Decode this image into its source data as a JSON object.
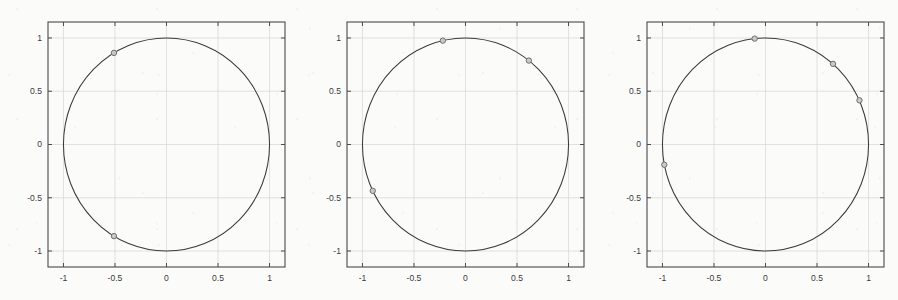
{
  "figure": {
    "background_color": "#fbfbfa",
    "axis_color": "#4a4a4a",
    "grid_color": "#d6d6d6",
    "curve_color": "#3b3b3b",
    "marker_edge_color": "#6f6f6f",
    "marker_face_color": "#c9c9c9",
    "panel_count": 3
  },
  "chart_data": [
    {
      "type": "scatter",
      "title": "",
      "xlabel": "",
      "ylabel": "",
      "xlim": [
        -1.15,
        1.15
      ],
      "ylim": [
        -1.15,
        1.15
      ],
      "xticks": [
        -1,
        -0.5,
        0,
        0.5,
        1
      ],
      "yticks": [
        -1,
        -0.5,
        0,
        0.5,
        1
      ],
      "xticklabels": [
        "-1",
        "-0.5",
        "0",
        "0.5",
        "1"
      ],
      "yticklabels": [
        "-1",
        "-0.5",
        "0",
        "0.5",
        "1"
      ],
      "grid": true,
      "legend": "none",
      "series": [
        {
          "name": "unit circle",
          "style": "line",
          "x": [],
          "y": []
        },
        {
          "name": "markers",
          "style": "open-circle",
          "points": [
            {
              "x": -0.51,
              "y": 0.86
            },
            {
              "x": -0.51,
              "y": -0.86
            }
          ]
        }
      ]
    },
    {
      "type": "scatter",
      "title": "",
      "xlabel": "",
      "ylabel": "",
      "xlim": [
        -1.15,
        1.15
      ],
      "ylim": [
        -1.15,
        1.15
      ],
      "xticks": [
        -1,
        -0.5,
        0,
        0.5,
        1
      ],
      "yticks": [
        -1,
        -0.5,
        0,
        0.5,
        1
      ],
      "xticklabels": [
        "-1",
        "-0.5",
        "0",
        "0.5",
        "1"
      ],
      "yticklabels": [
        "-1",
        "-0.5",
        "0",
        "0.5",
        "1"
      ],
      "grid": true,
      "legend": "none",
      "series": [
        {
          "name": "unit circle",
          "style": "line",
          "x": [],
          "y": []
        },
        {
          "name": "markers",
          "style": "open-circle",
          "points": [
            {
              "x": -0.22,
              "y": 0.975
            },
            {
              "x": 0.615,
              "y": 0.788
            },
            {
              "x": -0.9,
              "y": -0.435
            }
          ]
        }
      ]
    },
    {
      "type": "scatter",
      "title": "",
      "xlabel": "",
      "ylabel": "",
      "xlim": [
        -1.15,
        1.15
      ],
      "ylim": [
        -1.15,
        1.15
      ],
      "xticks": [
        -1,
        -0.5,
        0,
        0.5,
        1
      ],
      "yticks": [
        -1,
        -0.5,
        0,
        0.5,
        1
      ],
      "xticklabels": [
        "-1",
        "-0.5",
        "0",
        "0.5",
        "1"
      ],
      "yticklabels": [
        "-1",
        "-0.5",
        "0",
        "0.5",
        "1"
      ],
      "grid": true,
      "legend": "none",
      "series": [
        {
          "name": "unit circle",
          "style": "line",
          "x": [],
          "y": []
        },
        {
          "name": "markers",
          "style": "open-circle",
          "points": [
            {
              "x": -0.105,
              "y": 0.994
            },
            {
              "x": 0.655,
              "y": 0.757
            },
            {
              "x": 0.912,
              "y": 0.415
            },
            {
              "x": -0.982,
              "y": -0.19
            }
          ]
        }
      ]
    }
  ]
}
